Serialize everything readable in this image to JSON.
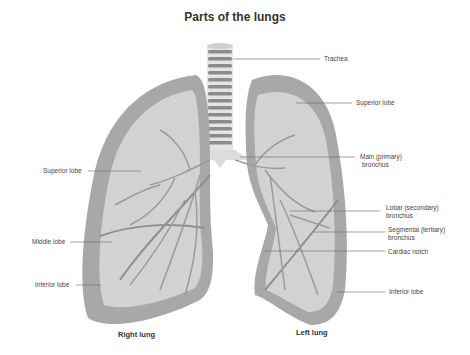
{
  "title": "Parts of the lungs",
  "labels": {
    "trachea": "Trachea",
    "left_superior_lobe": "Superior lobe",
    "main_bronchus_1": "Main (primary)",
    "main_bronchus_2": "bronchus",
    "lobar_bronchus_1": "Lobar (secondary)",
    "lobar_bronchus_2": "bronchus",
    "segmental_bronchus_1": "Segmental (tertiary)",
    "segmental_bronchus_2": "bronchus",
    "cardiac_notch": "Cardiac notch",
    "left_inferior_lobe": "Inferior lobe",
    "right_superior_lobe": "Superior lobe",
    "right_middle_lobe": "Middle lobe",
    "right_inferior_lobe": "Inferior lobe"
  },
  "lungs": {
    "right": "Right lung",
    "left": "Left lung"
  },
  "colors": {
    "lung_outer": "#a9a9a9",
    "lung_inner": "#d6d6d6",
    "lung_fill": "#c4c4c4",
    "trachea_ring": "#8a8a8a",
    "leader_line": "#666666"
  }
}
